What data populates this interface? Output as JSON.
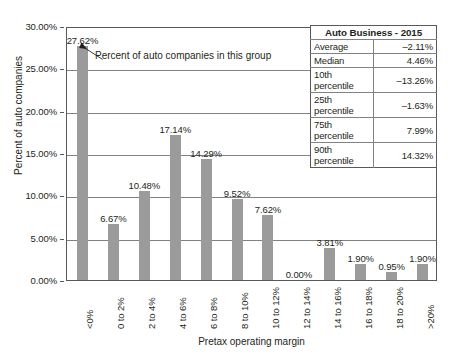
{
  "chart_data": {
    "type": "bar",
    "title": "",
    "xlabel": "Pretax operating margin",
    "ylabel": "Percent of auto companies",
    "categories": [
      "<0%",
      "0 to 2%",
      "2 to 4%",
      "4 to 6%",
      "6 to 8%",
      "8 to 10%",
      "10 to 12%",
      "12 to 14%",
      "14 to 16%",
      "16 to 18%",
      "18 to 20%",
      ">20%"
    ],
    "values": [
      27.62,
      6.67,
      10.48,
      17.14,
      14.29,
      9.52,
      7.62,
      0.0,
      3.81,
      1.9,
      0.95,
      1.9
    ],
    "value_labels": [
      "27.62%",
      "6.67%",
      "10.48%",
      "17.14%",
      "14.29%",
      "9.52%",
      "7.62%",
      "0.00%",
      "3.81%",
      "1.90%",
      "0.95%",
      "1.90%"
    ],
    "ylim": [
      0,
      30
    ],
    "ytick_labels": [
      "0.00%",
      "5.00%",
      "10.00%",
      "15.00%",
      "20.00%",
      "25.00%",
      "30.00%"
    ],
    "ytick_values": [
      0,
      5,
      10,
      15,
      20,
      25,
      30
    ],
    "grid": true,
    "legend": "none",
    "bar_color": "#9b9b9b",
    "axis_color": "#58595b",
    "grid_color": "#808285"
  },
  "annotation": {
    "text": "Percent of auto companies in this group",
    "arrow_icon": "arrow-up-left-icon"
  },
  "stats_table": {
    "title": "Auto Business - 2015",
    "rows": [
      {
        "label": "Average",
        "value": "–2.11%"
      },
      {
        "label": "Median",
        "value": "4.46%"
      },
      {
        "label": "10th percentile",
        "value": "–13.26%"
      },
      {
        "label": "25th percentile",
        "value": "–1.63%"
      },
      {
        "label": "75th percentile",
        "value": "7.99%"
      },
      {
        "label": "90th percentile",
        "value": "14.32%"
      }
    ]
  }
}
